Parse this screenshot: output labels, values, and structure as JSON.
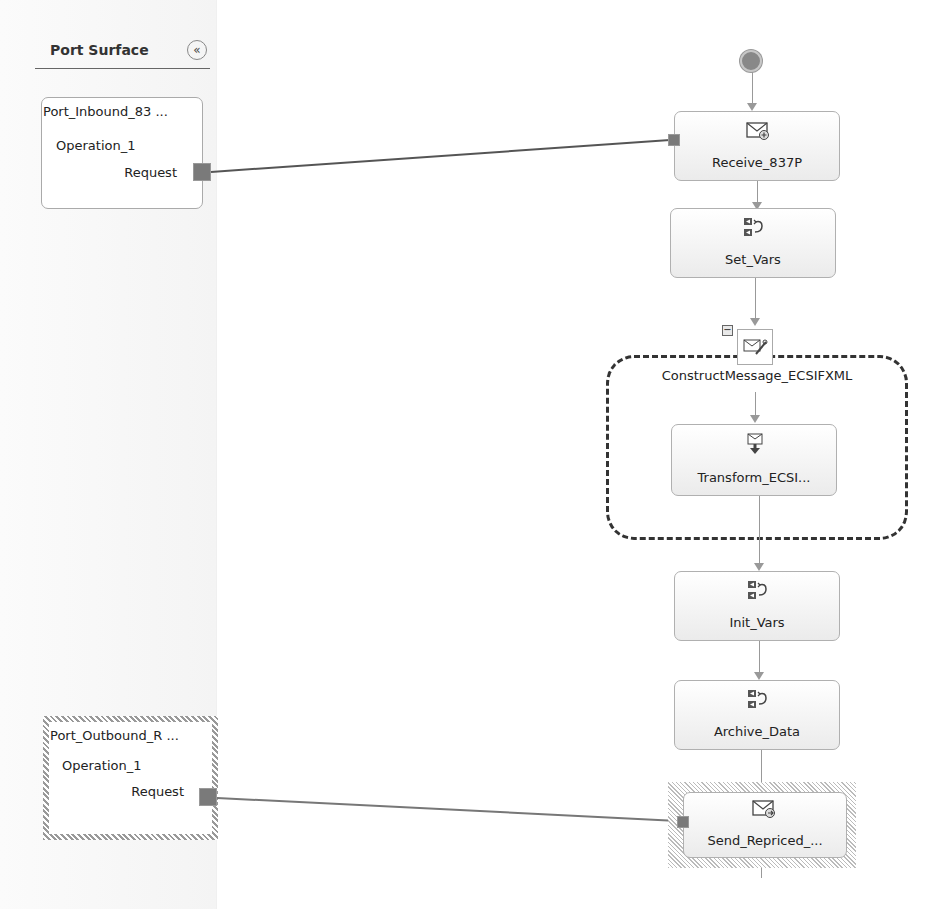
{
  "port_surface": {
    "title": "Port Surface",
    "collapse_icon": "double-chevron-left-icon",
    "collapse_glyph": "«",
    "ports": [
      {
        "name": "Port_Inbound_83 ...",
        "operation": "Operation_1",
        "message": "Request",
        "selected": false
      },
      {
        "name": "Port_Outbound_R ...",
        "operation": "Operation_1",
        "message": "Request",
        "selected": true
      }
    ]
  },
  "orchestration": {
    "start_icon": "start-circle-icon",
    "shapes": [
      {
        "label": "Receive_837P",
        "type": "receive",
        "icon": "receive-envelope-icon"
      },
      {
        "label": "Set_Vars",
        "type": "expression",
        "icon": "expression-icon"
      },
      {
        "label": "Transform_ECSI...",
        "type": "transform",
        "icon": "transform-icon"
      },
      {
        "label": "Init_Vars",
        "type": "expression",
        "icon": "expression-icon"
      },
      {
        "label": "Archive_Data",
        "type": "expression",
        "icon": "expression-icon"
      },
      {
        "label": "Send_Repriced_...",
        "type": "send",
        "icon": "send-envelope-icon"
      }
    ],
    "construct_scope": {
      "label": "ConstructMessage_ECSIFXML",
      "toggle": "−",
      "icon": "construct-message-icon"
    }
  },
  "colors": {
    "connector": "#7a7a7a",
    "flow_line": "#999999",
    "scope_border": "#333333"
  }
}
